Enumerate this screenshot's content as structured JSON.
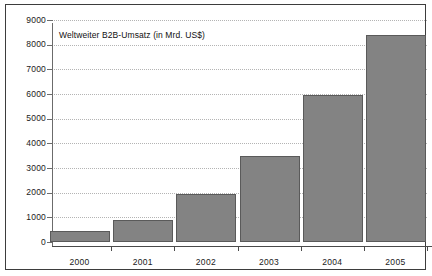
{
  "chart_data": {
    "type": "bar",
    "title": "Weltweiter B2B-Umsatz (in Mrd. US$)",
    "xlabel": "",
    "ylabel": "",
    "categories": [
      "2000",
      "2001",
      "2002",
      "2003",
      "2004",
      "2005"
    ],
    "values": [
      450,
      900,
      1950,
      3500,
      5950,
      8400
    ],
    "ylim": [
      0,
      9000
    ],
    "yticks": [
      0,
      1000,
      2000,
      3000,
      4000,
      5000,
      6000,
      7000,
      8000,
      9000
    ],
    "ytick_labels": [
      "0",
      "1000",
      "2000",
      "3000",
      "4000",
      "5000",
      "6000",
      "7000",
      "8000",
      "9000"
    ],
    "grid": true,
    "grid_axis": "y",
    "grid_style": "dotted",
    "legend": false,
    "legend_position": "none",
    "series": [
      {
        "name": "Weltweiter B2B-Umsatz",
        "values": [
          450,
          900,
          1950,
          3500,
          5950,
          8400
        ]
      }
    ],
    "colors": {
      "bar_fill": "#838383",
      "bar_edge": "#5a5a5a",
      "grid": "#b4b4b4",
      "axis": "#4a4a4a",
      "text": "#1a1a1a",
      "background": "#ffffff",
      "frame": "#3d3d3d"
    }
  }
}
